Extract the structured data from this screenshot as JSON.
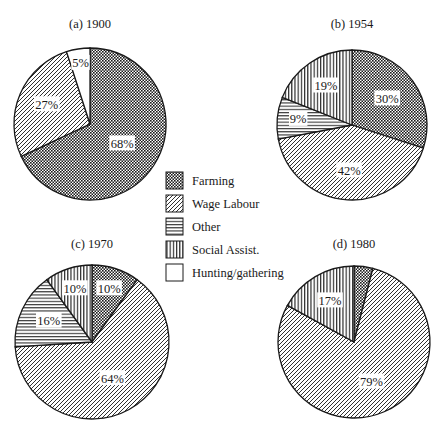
{
  "colors": {
    "ink": "#1a1a1a",
    "background": "#ffffff"
  },
  "legend": {
    "items": [
      {
        "key": "farming",
        "label": "Farming",
        "pattern": "crosshatch-dots"
      },
      {
        "key": "wage",
        "label": "Wage Labour",
        "pattern": "diagonal-lines"
      },
      {
        "key": "other",
        "label": "Other",
        "pattern": "horizontal-lines"
      },
      {
        "key": "social",
        "label": "Social Assist.",
        "pattern": "vertical-lines"
      },
      {
        "key": "hunting",
        "label": "Hunting/gathering",
        "pattern": "blank"
      }
    ]
  },
  "chart_data": [
    {
      "type": "pie",
      "title": "(a) 1900",
      "categories": [
        "Farming",
        "Wage Labour",
        "Hunting/gathering"
      ],
      "values": [
        68,
        27,
        5
      ],
      "labels": [
        "68%",
        "27%",
        "5%"
      ]
    },
    {
      "type": "pie",
      "title": "(b) 1954",
      "categories": [
        "Farming",
        "Wage Labour",
        "Other",
        "Social Assist."
      ],
      "values": [
        30,
        42,
        9,
        19
      ],
      "labels": [
        "30%",
        "42%",
        "9%",
        "19%"
      ]
    },
    {
      "type": "pie",
      "title": "(c) 1970",
      "categories": [
        "Farming",
        "Wage Labour",
        "Other",
        "Social Assist."
      ],
      "values": [
        10,
        64,
        16,
        10
      ],
      "labels": [
        "10%",
        "64%",
        "16%",
        "10%"
      ]
    },
    {
      "type": "pie",
      "title": "(d) 1980",
      "categories": [
        "Farming",
        "Wage Labour",
        "Social Assist."
      ],
      "values": [
        4,
        79,
        17
      ],
      "labels": [
        "",
        "79%",
        "17%"
      ]
    }
  ]
}
